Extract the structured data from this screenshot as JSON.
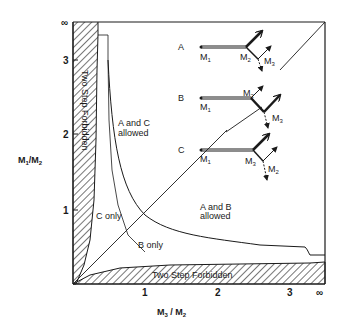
{
  "diagram": {
    "axes": {
      "y_label_main": "M",
      "y_label_sub1": "1",
      "y_label_sep": "/M",
      "y_label_sub2": "2",
      "x_label_main": "M",
      "x_label_sub1": "3",
      "x_label_sep": " / M",
      "x_label_sub2": "2",
      "y_ticks": [
        "1",
        "2",
        "3",
        "∞"
      ],
      "x_ticks": [
        "1",
        "2",
        "3",
        "∞"
      ]
    },
    "regions": {
      "left_forbidden": "Two Step Forbidden",
      "bottom_forbidden": "Two Step Forbidden",
      "a_and_c_line1": "A and C",
      "a_and_c_line2": "allowed",
      "a_and_b_line1": "A and B",
      "a_and_b_line2": "allowed",
      "c_only": "C only",
      "b_only": "B only"
    },
    "insets": [
      {
        "label": "A",
        "m_start": "M",
        "m_start_sub": "1",
        "m_mid": "M",
        "m_mid_sub": "2",
        "m_end": "M",
        "m_end_sub": "3"
      },
      {
        "label": "B",
        "m_start": "M",
        "m_start_sub": "1",
        "m_mid": "M",
        "m_mid_sub": "2",
        "m_end": "M",
        "m_end_sub": "3"
      },
      {
        "label": "C",
        "m_start": "M",
        "m_start_sub": "1",
        "m_mid": "M",
        "m_mid_sub": "3",
        "m_end": "M",
        "m_end_sub": "2"
      }
    ],
    "colors": {
      "ink": "#1a1a1a",
      "background": "#ffffff"
    }
  }
}
